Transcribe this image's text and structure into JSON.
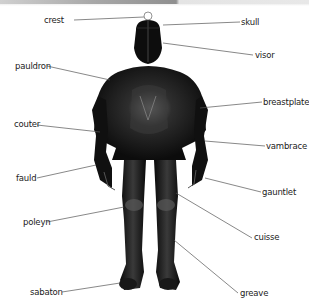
{
  "diagram": {
    "accent_colors": {
      "armor": "#111111",
      "highlight": "#6a6a6a",
      "leader_line": "#555555",
      "topbar": "#a0a0a0"
    },
    "labels_left": [
      {
        "id": "crest",
        "text": "crest"
      },
      {
        "id": "pauldron",
        "text": "pauldron"
      },
      {
        "id": "couter",
        "text": "couter"
      },
      {
        "id": "fauld",
        "text": "fauld"
      },
      {
        "id": "poleyn",
        "text": "poleyn"
      },
      {
        "id": "sabaton",
        "text": "sabaton"
      }
    ],
    "labels_right": [
      {
        "id": "skull",
        "text": "skull"
      },
      {
        "id": "visor",
        "text": "visor"
      },
      {
        "id": "breastplate",
        "text": "breastplate"
      },
      {
        "id": "vambrace",
        "text": "vambrace"
      },
      {
        "id": "gauntlet",
        "text": "gauntlet"
      },
      {
        "id": "cuisse",
        "text": "cuisse"
      },
      {
        "id": "greave",
        "text": "greave"
      }
    ]
  }
}
